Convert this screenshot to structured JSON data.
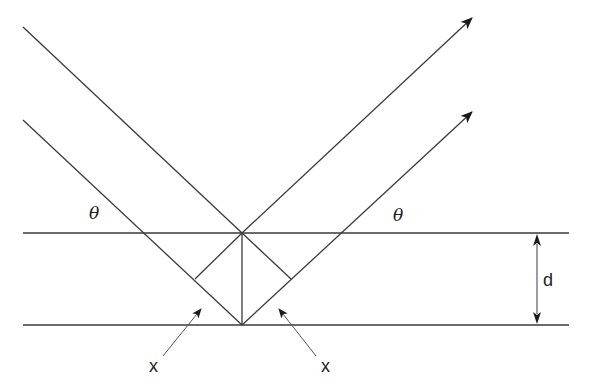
{
  "diagram": {
    "labels": {
      "theta_left": "θ",
      "theta_right": "θ",
      "spacing": "d",
      "path_left": "x",
      "path_right": "x"
    },
    "colors": {
      "line": "#3a3a3a",
      "arrow": "#1a1a1a",
      "background": "#ffffff"
    },
    "elements": {
      "planes": [
        "upper lattice plane",
        "lower lattice plane"
      ],
      "rays": [
        "incident ray 1",
        "incident ray 2",
        "reflected ray 1",
        "reflected ray 2"
      ],
      "construction": [
        "normal between planes",
        "perpendicular left",
        "perpendicular right"
      ],
      "annotations": [
        "spacing arrow d",
        "path difference arrow left",
        "path difference arrow right"
      ]
    }
  }
}
